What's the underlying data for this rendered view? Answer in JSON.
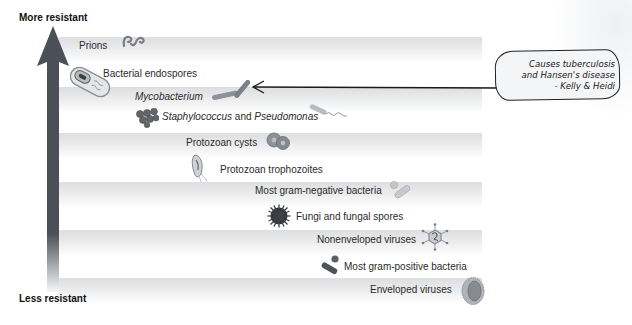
{
  "figure": {
    "top_label": "More resistant",
    "bottom_label": "Less resistant",
    "arrow_color": "#4a5055",
    "band_color": "#dcdee0",
    "items": [
      {
        "label": "Prions",
        "italic": false,
        "icon": "prion-icon"
      },
      {
        "label": "Bacterial endospores",
        "italic": false,
        "icon": "endospore-icon"
      },
      {
        "label": "Mycobacterium",
        "italic": true,
        "icon": "mycobacterium-icon"
      },
      {
        "label_parts": [
          "Staphylococcus",
          " and ",
          "Pseudomonas"
        ],
        "icon": "staphylococcus-icon",
        "icon2": "pseudomonas-icon"
      },
      {
        "label": "Protozoan cysts",
        "italic": false,
        "icon": "protozoan-cyst-icon"
      },
      {
        "label": "Protozoan trophozoites",
        "italic": false,
        "icon": "trophozoite-icon"
      },
      {
        "label": "Most gram-negative bacteria",
        "italic": false,
        "icon": "gram-negative-icon"
      },
      {
        "label": "Fungi and fungal spores",
        "italic": false,
        "icon": "fungal-spore-icon"
      },
      {
        "label": "Nonenveloped viruses",
        "italic": false,
        "icon": "nonenveloped-virus-icon"
      },
      {
        "label": "Most gram-positive bacteria",
        "italic": false,
        "icon": "gram-positive-icon"
      },
      {
        "label": "Enveloped viruses",
        "italic": false,
        "icon": "enveloped-virus-icon"
      }
    ]
  },
  "annotation": {
    "lines": [
      "Causes tuberculosis",
      "and Hansen's disease",
      "- Kelly & Heidi"
    ],
    "points_to": "Mycobacterium"
  }
}
